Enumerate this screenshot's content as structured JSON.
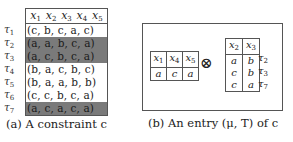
{
  "figure_a": {
    "columns": [
      "x1",
      "x2",
      "x3",
      "x4",
      "x5"
    ],
    "rows": [
      {
        "label": "τ1",
        "tuple": "(c,  b,  c,  a,  c)",
        "highlighted": false
      },
      {
        "label": "τ2",
        "tuple": "(a,  a,  b,  c,  a)",
        "highlighted": true
      },
      {
        "label": "τ3",
        "tuple": "(a,  c,  b,  c,  a)",
        "highlighted": true
      },
      {
        "label": "τ4",
        "tuple": "(b,  a,  c,  b,  c)",
        "highlighted": false
      },
      {
        "label": "τ5",
        "tuple": "(b,  a,  a,  b,  b)",
        "highlighted": false
      },
      {
        "label": "τ6",
        "tuple": "(c,  c,  b,  c,  a)",
        "highlighted": false
      },
      {
        "label": "τ7",
        "tuple": "(a,  c,  a,  c,  a)",
        "highlighted": true
      }
    ],
    "caption": "(a) A constraint c",
    "highlight_color": "#7a7a7a"
  },
  "figure_b": {
    "mu_table": {
      "columns": [
        "x1",
        "x4",
        "x5"
      ],
      "values": [
        "a",
        "c",
        "a"
      ]
    },
    "operator": "⊗",
    "t_table": {
      "columns": [
        "x2",
        "x3"
      ],
      "rows": [
        {
          "values": [
            "a",
            "b"
          ],
          "label": "τ2"
        },
        {
          "values": [
            "c",
            "b"
          ],
          "label": "τ3"
        },
        {
          "values": [
            "c",
            "a"
          ],
          "label": "τ7"
        }
      ]
    },
    "caption": "(b) An entry (μ, T) of c"
  }
}
